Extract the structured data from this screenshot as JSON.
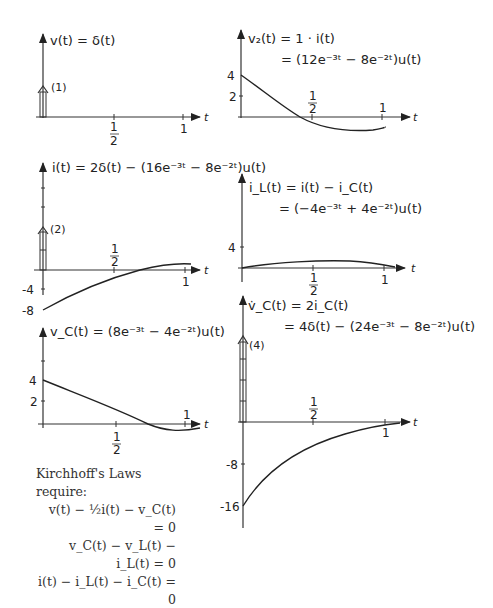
{
  "panels": [
    {
      "id": "v",
      "label": "v(t) = δ(t)",
      "impulse_label": "(1)",
      "t_ticks": [
        "1/2",
        "1"
      ],
      "t_axis": "t"
    },
    {
      "id": "v2",
      "label_line1": "v₂(t) = 1 · i̇(t)",
      "label_line2": "= (12e⁻³ᵗ − 8e⁻²ᵗ)u(t)",
      "y_ticks": [
        "4",
        "2"
      ],
      "t_ticks": [
        "1/2",
        "1"
      ],
      "t_axis": "t"
    },
    {
      "id": "i",
      "label": "i(t) = 2δ(t) − (16e⁻³ᵗ − 8e⁻²ᵗ)u(t)",
      "impulse_label": "(2)",
      "y_ticks": [
        "-4",
        "-8"
      ],
      "t_ticks": [
        "1/2",
        "1"
      ],
      "t_axis": "t"
    },
    {
      "id": "iL",
      "label_line1": "i_L(t) = i(t) − i_C(t)",
      "label_line2": "= (−4e⁻³ᵗ + 4e⁻²ᵗ)u(t)",
      "y_ticks": [
        "4"
      ],
      "t_ticks": [
        "1/2",
        "1"
      ],
      "t_axis": "t"
    },
    {
      "id": "vC",
      "label": "v_C(t) = (8e⁻³ᵗ − 4e⁻²ᵗ)u(t)",
      "y_ticks": [
        "4",
        "2"
      ],
      "t_ticks": [
        "1/2",
        "1"
      ],
      "t_axis": "t"
    },
    {
      "id": "vCdot",
      "label_line1": "v̇_C(t) = 2i_C(t)",
      "label_line2": "= 4δ(t) − (24e⁻³ᵗ − 8e⁻²ᵗ)u(t)",
      "impulse_label": "(4)",
      "y_ticks": [
        "-8",
        "-16"
      ],
      "t_ticks": [
        "1/2",
        "1"
      ],
      "t_axis": "t"
    }
  ],
  "kirchhoff": {
    "title": "Kirchhoff's Laws require:",
    "equations": [
      "v(t) − ½i(t) − v_C(t) = 0",
      "v_C(t) − v_L(t) − i_L(t) = 0",
      "i(t) − i_L(t) − i_C(t) = 0"
    ]
  },
  "tick_text": {
    "half_num": "1",
    "half_den": "2",
    "one": "1",
    "t": "t"
  }
}
